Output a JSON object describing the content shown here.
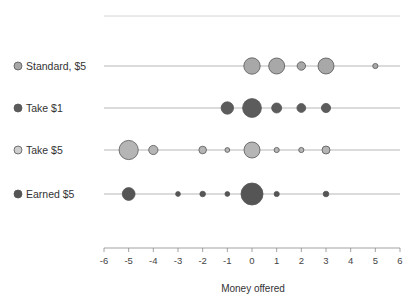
{
  "chart_data": {
    "type": "scatter",
    "title": "",
    "subtitle": "",
    "xlabel": "Money offered",
    "ylabel": "",
    "xlim": [
      -6,
      6
    ],
    "xticks": [
      -6,
      -5,
      -4,
      -3,
      -2,
      -1,
      0,
      1,
      2,
      3,
      4,
      5,
      6
    ],
    "xticklabels": [
      "-6",
      "-5",
      "-4",
      "-3",
      "-2",
      "-1",
      "0",
      "1",
      "2",
      "3",
      "4",
      "5",
      "6"
    ],
    "grid": false,
    "legend_position": "left",
    "note": "Bubble/dot plot: one horizontal row per condition; marker area encodes frequency/count at each money-offered value.",
    "categories": [
      {
        "label": "Standard, $5",
        "color": "#a8a8a8",
        "edge_color": "#555555",
        "points": [
          {
            "x": 0,
            "size": 8.2
          },
          {
            "x": 1,
            "size": 8.0
          },
          {
            "x": 2,
            "size": 4.2
          },
          {
            "x": 3,
            "size": 8.0
          },
          {
            "x": 5,
            "size": 2.6
          }
        ]
      },
      {
        "label": "Take $1",
        "color": "#5c5c5c",
        "edge_color": "#444444",
        "points": [
          {
            "x": -1,
            "size": 6.2
          },
          {
            "x": 0,
            "size": 9.4
          },
          {
            "x": 1,
            "size": 5.0
          },
          {
            "x": 2,
            "size": 4.4
          },
          {
            "x": 3,
            "size": 4.6
          }
        ]
      },
      {
        "label": "Take $5",
        "color": "#b5b5b5",
        "edge_color": "#666666",
        "points": [
          {
            "x": -5,
            "size": 9.6
          },
          {
            "x": -4,
            "size": 4.6
          },
          {
            "x": -2,
            "size": 3.8
          },
          {
            "x": -1,
            "size": 2.4
          },
          {
            "x": 0,
            "size": 8.0
          },
          {
            "x": 1,
            "size": 2.6
          },
          {
            "x": 2,
            "size": 2.6
          },
          {
            "x": 3,
            "size": 4.0
          }
        ]
      },
      {
        "label": "Earned $5",
        "color": "#555555",
        "edge_color": "#3d3d3d",
        "points": [
          {
            "x": -5,
            "size": 6.4
          },
          {
            "x": -3,
            "size": 2.4
          },
          {
            "x": -2,
            "size": 2.8
          },
          {
            "x": -1,
            "size": 2.4
          },
          {
            "x": 0,
            "size": 11.0
          },
          {
            "x": 1,
            "size": 2.6
          },
          {
            "x": 3,
            "size": 2.8
          }
        ]
      }
    ]
  },
  "legend": {
    "items": [
      {
        "label": "Standard, $5",
        "color": "#a8a8a8",
        "size": 4.0
      },
      {
        "label": "Take $1",
        "color": "#5c5c5c",
        "size": 4.0
      },
      {
        "label": "Take $5",
        "color": "#cfcfcf",
        "size": 4.0
      },
      {
        "label": "Earned $5",
        "color": "#555555",
        "size": 4.0
      }
    ]
  },
  "axis": {
    "title": "Money offered",
    "ticks": [
      "-6",
      "-5",
      "-4",
      "-3",
      "-2",
      "-1",
      "0",
      "1",
      "2",
      "3",
      "4",
      "5",
      "6"
    ]
  }
}
